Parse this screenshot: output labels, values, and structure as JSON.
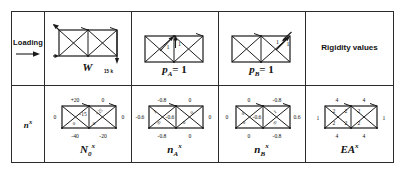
{
  "figure": {
    "type": "engineering-table",
    "title_row_label": "Loading",
    "row2_label": "n",
    "row2_label_sup": "x"
  },
  "table": {
    "columns": [
      "label",
      "col1",
      "col2",
      "col3",
      "col4"
    ],
    "rows": [
      {
        "name": "loading-row",
        "label": "Loading",
        "cells": [
          {
            "caption": "W",
            "load_label": "15 k"
          },
          {
            "caption": "p",
            "caption_sub": "A",
            "caption_eq": " = 1"
          },
          {
            "caption": "p",
            "caption_sub": "B",
            "caption_eq": " = 1"
          },
          {
            "text": "Rigidity values"
          }
        ]
      },
      {
        "name": "force-row",
        "label": "n",
        "label_sup": "x",
        "cells": [
          {
            "caption": "N",
            "caption_sub": "0",
            "caption_sup": "x"
          },
          {
            "caption": "n",
            "caption_sub": "A",
            "caption_sup": "x"
          },
          {
            "caption": "n",
            "caption_sub": "B",
            "caption_sup": "x"
          },
          {
            "caption": "EA",
            "caption_sup": "x"
          }
        ]
      }
    ]
  },
  "loading_cell": {
    "label": "Loading",
    "arrow": "right-arrow-icon"
  },
  "rigidity_cell": {
    "text": "Rigidity values"
  },
  "diagrams": {
    "W": {
      "caption": "W",
      "load_label": "15 k",
      "arrows": [
        {
          "name": "top-left-diagonal-arrow",
          "dir": "up-left"
        },
        {
          "name": "support-arrow-left",
          "dir": "right"
        },
        {
          "name": "right-end-down-arrow",
          "dir": "down",
          "label": "15 k"
        }
      ]
    },
    "pA": {
      "caption_main": "p",
      "caption_sub": "A",
      "caption_eq": "= 1",
      "unit_labels": [
        "1",
        "1"
      ]
    },
    "pB": {
      "caption_main": "p",
      "caption_sub": "B",
      "caption_eq": "= 1",
      "unit_labels": [
        "1",
        "1"
      ]
    },
    "N0x": {
      "caption_main": "N",
      "caption_sub": "0",
      "caption_sup": "x",
      "values": {
        "top_left": "+20",
        "top_right": "0",
        "bottom_left": "-40",
        "bottom_right": "-20",
        "center_vertical": "-15",
        "left_vertical": "0",
        "right_vertical": "0",
        "diagonal_upper": "+25",
        "diagonal_lower_left": "0",
        "diagonal_lower_right": "0"
      }
    },
    "nAx": {
      "caption_main": "n",
      "caption_sub": "A",
      "caption_sup": "x",
      "values": {
        "top_left": "-0.8",
        "top_right": "0",
        "bottom_left": "-0.8",
        "bottom_right": "0",
        "center_vertical": "-0.6",
        "left_vertical": "-0.6",
        "right_vertical": "0",
        "diagonal_left_upper": "1",
        "diagonal_left_lower": "0",
        "diagonal_right": "0"
      }
    },
    "nBx": {
      "caption_main": "n",
      "caption_sub": "B",
      "caption_sup": "x",
      "values": {
        "top_left": "0",
        "top_right": "-0.8",
        "bottom_left": "0",
        "bottom_right": "-0.8",
        "center_vertical": "-0.6",
        "left_vertical": "0",
        "right_vertical": "0.6",
        "diagonal_left_upper": "0",
        "diagonal_left_lower": "0",
        "diagonal_right_upper": "1",
        "diagonal_right_lower": "0"
      }
    },
    "EAx": {
      "caption_main": "EA",
      "caption_sup": "x",
      "values": {
        "top_left": "4",
        "top_right": "4",
        "bottom_left": "4",
        "bottom_right": "4",
        "left_vertical": "1",
        "center_vertical_upper": "2",
        "center_vertical_lower": "2",
        "right_vertical": "1",
        "diagonal_left": "2",
        "diagonal_right": "2"
      }
    }
  },
  "colors": {
    "ink": "#1a1a1a",
    "rule": "#2b2b2b",
    "background": "#ffffff"
  }
}
